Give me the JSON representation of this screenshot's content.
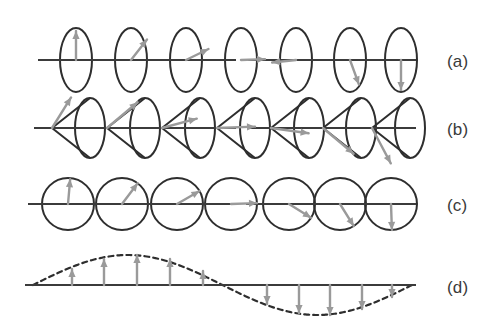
{
  "figure": {
    "width": 499,
    "height": 326,
    "background": "#ffffff",
    "axis_color": "#3b3b3b",
    "outline_color": "#2e2e2e",
    "arrow_color": "#9a9a9a",
    "label_color": "#3a3a3a"
  },
  "rows": [
    {
      "id": "row-a",
      "label": "(a)",
      "label_x": 447,
      "label_y": 52,
      "description": "linear-polarization-ellipses",
      "axis": {
        "x1": 38,
        "x2": 416,
        "y": 60
      },
      "axis_break": {
        "x1": 236,
        "x2": 248
      },
      "shape": "ellipse",
      "rx": 16,
      "ry": 32,
      "items": [
        {
          "cx": 76,
          "angle_deg": 90,
          "length": 29,
          "label": "up"
        },
        {
          "cx": 131,
          "angle_deg": 52,
          "length": 26,
          "label": "up-right"
        },
        {
          "cx": 186,
          "angle_deg": 26,
          "length": 25,
          "label": "right-up"
        },
        {
          "cx": 241,
          "angle_deg": 2,
          "length": 24,
          "label": "right"
        },
        {
          "cx": 296,
          "angle_deg": 186,
          "length": 24,
          "label": "left"
        },
        {
          "cx": 350,
          "angle_deg": -70,
          "length": 26,
          "label": "down-right"
        },
        {
          "cx": 401,
          "angle_deg": -90,
          "length": 30,
          "label": "down"
        }
      ]
    },
    {
      "id": "row-b",
      "label": "(b)",
      "label_x": 447,
      "label_y": 120,
      "description": "cone-plus-ellipse-phase-fronts",
      "axis": {
        "x1": 34,
        "x2": 416,
        "y": 128
      },
      "axis_break": {
        "x1": 236,
        "x2": 250
      },
      "shape": "cone-ellipse",
      "rx": 15,
      "ry": 30,
      "cone_depth": 38,
      "items": [
        {
          "cx": 84,
          "angle_deg": 58,
          "length": 36,
          "label": "up-right"
        },
        {
          "cx": 139,
          "angle_deg": 40,
          "length": 40,
          "label": "up-right"
        },
        {
          "cx": 194,
          "angle_deg": 15,
          "length": 36,
          "label": "right-up"
        },
        {
          "cx": 249,
          "angle_deg": 2,
          "length": 38,
          "label": "right"
        },
        {
          "cx": 303,
          "angle_deg": -8,
          "length": 38,
          "label": "right-down"
        },
        {
          "cx": 355,
          "angle_deg": -40,
          "length": 40,
          "label": "down-right"
        },
        {
          "cx": 404,
          "angle_deg": -62,
          "length": 40,
          "label": "down-right"
        }
      ]
    },
    {
      "id": "row-c",
      "label": "(c)",
      "label_x": 447,
      "label_y": 196,
      "description": "circular-polarization-circles",
      "axis": {
        "x1": 28,
        "x2": 416,
        "y": 204
      },
      "axis_break": {
        "x1": 232,
        "x2": 246
      },
      "shape": "circle",
      "rx": 26,
      "ry": 26,
      "items": [
        {
          "cx": 68,
          "angle_deg": 85,
          "length": 25,
          "label": "up"
        },
        {
          "cx": 122,
          "angle_deg": 53,
          "length": 26,
          "label": "up-right"
        },
        {
          "cx": 177,
          "angle_deg": 30,
          "length": 26,
          "label": "right-up"
        },
        {
          "cx": 231,
          "angle_deg": 2,
          "length": 26,
          "label": "right"
        },
        {
          "cx": 289,
          "angle_deg": -32,
          "length": 26,
          "label": "down-right"
        },
        {
          "cx": 340,
          "angle_deg": -58,
          "length": 26,
          "label": "down-right"
        },
        {
          "cx": 391,
          "angle_deg": -88,
          "length": 26,
          "label": "down"
        }
      ]
    },
    {
      "id": "row-d",
      "label": "(d)",
      "label_x": 447,
      "label_y": 278,
      "description": "transverse-sine-wave-with-field-vectors",
      "axis": {
        "x1": 25,
        "x2": 416,
        "y": 285
      },
      "shape": "sine",
      "wave": {
        "x_start": 33,
        "x_end": 412,
        "amplitude": 30,
        "cycles": 1,
        "dash": "5 4"
      },
      "arrows": [
        {
          "x": 72,
          "dy": 16
        },
        {
          "x": 104,
          "dy": 26
        },
        {
          "x": 137,
          "dy": 30
        },
        {
          "x": 170,
          "dy": 26
        },
        {
          "x": 203,
          "dy": 14
        },
        {
          "x": 267,
          "dy": -19
        },
        {
          "x": 299,
          "dy": -28
        },
        {
          "x": 330,
          "dy": -30
        },
        {
          "x": 362,
          "dy": -24
        },
        {
          "x": 392,
          "dy": -12
        }
      ]
    }
  ]
}
